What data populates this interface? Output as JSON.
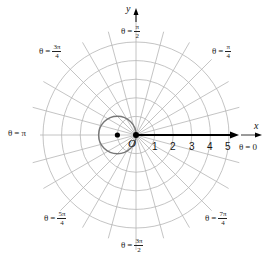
{
  "figure": {
    "center": [
      136,
      135
    ],
    "ring_spacing": 18.6,
    "grid_color": "#b5b5b5",
    "curve_color": "#777777",
    "axis_color": "#000000"
  },
  "axes": {
    "x_name": "x",
    "y_name": "y",
    "origin_label": "O"
  },
  "ticks": [
    "1",
    "2",
    "3",
    "4",
    "5"
  ],
  "angle_labels": [
    {
      "id": "theta-0",
      "theta": "θ",
      "eq": "=",
      "value": "0"
    },
    {
      "id": "theta-pi-4",
      "theta": "θ",
      "eq": "=",
      "num": "π",
      "den": "4"
    },
    {
      "id": "theta-pi-2",
      "theta": "θ",
      "eq": "=",
      "num": "π",
      "den": "2"
    },
    {
      "id": "theta-3pi-4",
      "theta": "θ",
      "eq": "=",
      "num": "3π",
      "den": "4"
    },
    {
      "id": "theta-pi",
      "theta": "θ",
      "eq": "=",
      "value": "π"
    },
    {
      "id": "theta-5pi-4",
      "theta": "θ",
      "eq": "=",
      "num": "5π",
      "den": "4"
    },
    {
      "id": "theta-3pi-2",
      "theta": "θ",
      "eq": "=",
      "num": "3π",
      "den": "2"
    },
    {
      "id": "theta-7pi-4",
      "theta": "θ",
      "eq": "=",
      "num": "7π",
      "den": "4"
    }
  ],
  "chart_data": {
    "type": "polar",
    "title": "",
    "grid": {
      "rings": [
        1,
        2,
        3,
        4,
        5
      ],
      "radial_lines_every_deg": 15
    },
    "curves": [
      {
        "name": "circle",
        "equation": "r = -2cosθ",
        "center_xy": [
          -1,
          0
        ],
        "radius": 1
      }
    ],
    "points": [
      {
        "label": "O",
        "xy": [
          0,
          0
        ]
      },
      {
        "label": "center",
        "xy": [
          -1,
          0
        ]
      }
    ],
    "arrow": {
      "from_xy": [
        0,
        0
      ],
      "to_xy": [
        5.4,
        0
      ]
    },
    "angle_labels": [
      "θ = 0",
      "θ = π/4",
      "θ = π/2",
      "θ = 3π/4",
      "θ = π",
      "θ = 5π/4",
      "θ = 3π/2",
      "θ = 7π/4"
    ],
    "r_tick_labels": [
      1,
      2,
      3,
      4,
      5
    ]
  }
}
